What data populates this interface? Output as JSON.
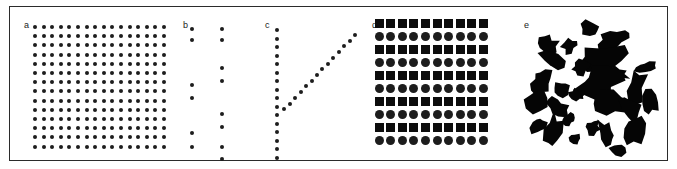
{
  "figure": {
    "width": 677,
    "height": 169,
    "background_color": "#ffffff",
    "frame_color": "#2b2b2b",
    "mark_color": "#1d1d1d"
  },
  "panels": [
    {
      "label": "a",
      "name": "panel-a-regular-lattice",
      "description": "Regular square lattice of small uniform dots",
      "pattern_type": "regular-grid",
      "mark_shape": "circle",
      "rows": 14,
      "cols": 16,
      "dot_diameter": 4,
      "spacing_x": 8.6,
      "spacing_y": 9.2,
      "origin_x": 25,
      "origin_y": 20,
      "count": 224
    },
    {
      "label": "b",
      "name": "panel-b-sparse-pairs",
      "description": "Two sparse vertical columns of widely separated dot pairs",
      "pattern_type": "clustered-pairs",
      "mark_shape": "circle",
      "dot_diameter": 4,
      "columns": [
        {
          "x": 8,
          "pair_y": [
            8,
            19,
            64,
            77,
            112,
            126
          ]
        },
        {
          "x": 38,
          "pair_y": [
            8,
            19,
            47,
            60,
            93,
            106,
            126,
            138
          ]
        }
      ],
      "count": 14
    },
    {
      "label": "c",
      "name": "panel-c-v-shape",
      "description": "V / check-mark arrangement: vertical column of dots with diagonal arm rising to upper right",
      "pattern_type": "linear-aligned",
      "mark_shape": "circle",
      "dot_diameter": 4,
      "vertical_arm": {
        "x": 8,
        "y_start": 9,
        "y_end": 137,
        "count": 16
      },
      "diagonal_arm": {
        "x_start": 10,
        "y_start": 94,
        "x_end": 86,
        "y_end": 14,
        "count": 14
      },
      "count": 29
    },
    {
      "label": "d",
      "name": "panel-d-alternating-lattice",
      "description": "Regular lattice with alternating rows of large filled squares and large filled circles",
      "pattern_type": "regular-grid-alternating",
      "mark_shapes": [
        "square",
        "circle"
      ],
      "rows": 10,
      "cols": 10,
      "mark_size": 9,
      "spacing_x": 11.6,
      "spacing_y": 13.1,
      "origin_x": 9,
      "origin_y": 16,
      "row_shape_sequence": [
        "square",
        "circle",
        "square",
        "circle",
        "square",
        "circle",
        "square",
        "circle",
        "square",
        "circle"
      ],
      "count": 100
    },
    {
      "label": "e",
      "name": "panel-e-irregular-blobs",
      "description": "Irregular clustered black blobs of varying size and orientation (random aggregated pattern)",
      "pattern_type": "random-clustered",
      "mark_shape": "irregular-blob",
      "blob_count": 27
    }
  ],
  "chart_data": {
    "type": "scatter",
    "title": "",
    "xlabel": "",
    "ylabel": "",
    "panel_labels": [
      "a",
      "b",
      "c",
      "d",
      "e"
    ],
    "series": [
      {
        "name": "a",
        "pattern": "regular-grid",
        "n_points": 224
      },
      {
        "name": "b",
        "pattern": "clustered-pairs",
        "n_points": 14
      },
      {
        "name": "c",
        "pattern": "linear-aligned",
        "n_points": 29
      },
      {
        "name": "d",
        "pattern": "regular-grid-alternating",
        "n_points": 100
      },
      {
        "name": "e",
        "pattern": "random-clustered",
        "n_points": 27
      }
    ],
    "grid": false,
    "legend": "none"
  }
}
